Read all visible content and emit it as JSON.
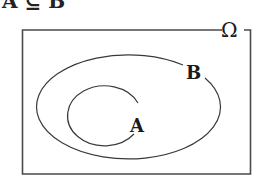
{
  "diagram": {
    "type": "venn",
    "caption": "A ⊆ B",
    "universe_label": "Ω",
    "sets": [
      {
        "id": "B",
        "label": "B",
        "contains": [
          "A"
        ]
      },
      {
        "id": "A",
        "label": "A",
        "contains": []
      }
    ],
    "relation": "A is a subset of B; both within universe Ω",
    "colors": {
      "stroke": "#3a3a3a",
      "background": "#ffffff",
      "text": "#1a1a1a"
    }
  }
}
